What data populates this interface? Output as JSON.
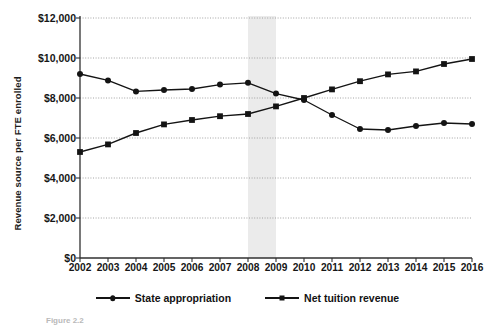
{
  "figure": {
    "caption": "Figure 2.2"
  },
  "chart_data": {
    "type": "line",
    "title": "",
    "xlabel": "",
    "ylabel": "Revenue source per FTE enrolled",
    "categories": [
      "2002",
      "2003",
      "2004",
      "2005",
      "2006",
      "2007",
      "2008",
      "2009",
      "2010",
      "2011",
      "2012",
      "2013",
      "2014",
      "2015",
      "2016"
    ],
    "ylim": [
      0,
      12000
    ],
    "ytick_values": [
      0,
      2000,
      4000,
      6000,
      8000,
      10000,
      12000
    ],
    "ytick_labels": [
      "$0",
      "$2,000",
      "$4,000",
      "$6,000",
      "$8,000",
      "$10,000",
      "$12,000"
    ],
    "grid": true,
    "grid_axis": "y",
    "legend_position": "bottom",
    "series": [
      {
        "name": "State appropriation",
        "marker": "circle",
        "values": [
          9200,
          8880,
          8330,
          8400,
          8450,
          8670,
          8760,
          8220,
          7900,
          7150,
          6450,
          6400,
          6600,
          6750,
          6700
        ]
      },
      {
        "name": "Net tuition revenue",
        "marker": "square",
        "values": [
          5300,
          5680,
          6250,
          6680,
          6900,
          7090,
          7200,
          7580,
          8000,
          8430,
          8840,
          9180,
          9330,
          9700,
          9950
        ]
      }
    ],
    "shaded_band": {
      "label": "",
      "from": "2008",
      "to": "2009",
      "color": "#ebebeb"
    }
  }
}
